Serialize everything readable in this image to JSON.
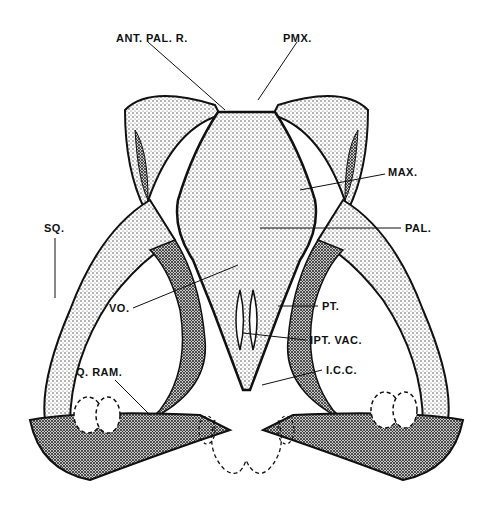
{
  "figure": {
    "labels": [
      {
        "id": "ant-pal-r",
        "text": "ANT. PAL. R.",
        "x": 116,
        "y": 32
      },
      {
        "id": "pmx",
        "text": "PMX.",
        "x": 283,
        "y": 32
      },
      {
        "id": "max",
        "text": "MAX.",
        "x": 388,
        "y": 166
      },
      {
        "id": "pal",
        "text": "PAL.",
        "x": 405,
        "y": 222
      },
      {
        "id": "sq",
        "text": "SQ.",
        "x": 44,
        "y": 222
      },
      {
        "id": "vo",
        "text": "VO.",
        "x": 109,
        "y": 302
      },
      {
        "id": "pt",
        "text": "PT.",
        "x": 322,
        "y": 300
      },
      {
        "id": "ipt-vac",
        "text": "IPT. VAC.",
        "x": 310,
        "y": 334
      },
      {
        "id": "icc",
        "text": "I.C.C.",
        "x": 326,
        "y": 364
      },
      {
        "id": "q-ram",
        "text": "Q. RAM.",
        "x": 76,
        "y": 366
      }
    ],
    "colors": {
      "ink": "#111111",
      "paper": "#ffffff",
      "stipple": "#555555"
    }
  }
}
